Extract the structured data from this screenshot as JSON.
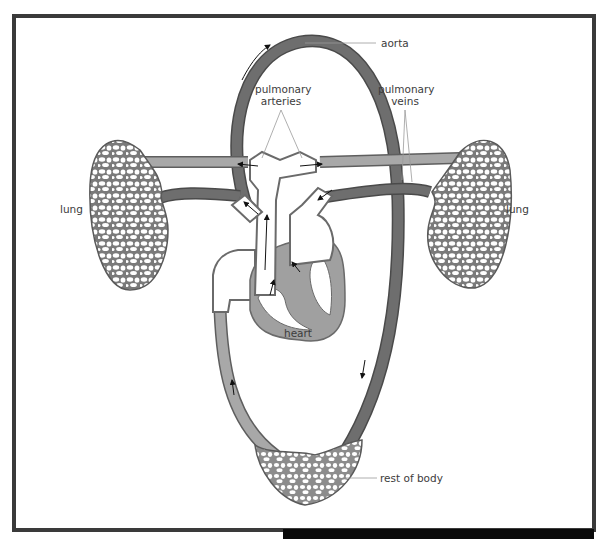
{
  "diagram": {
    "labels": {
      "aorta": "aorta",
      "pulmonary_arteries_line1": "pulmonary",
      "pulmonary_arteries_line2": "arteries",
      "pulmonary_veins_line1": "pulmonary",
      "pulmonary_veins_line2": "veins",
      "lung_left": "lung",
      "lung_right": "lung",
      "heart": "heart",
      "rest_of_body": "rest of body"
    },
    "colors": {
      "frame": "#3a3a3a",
      "oxygenated_vessel": "#6e6e6e",
      "deoxygenated_vessel": "#a8a8a8",
      "heart_wall": "#a0a0a0",
      "vessel_outline": "#4a4a4a",
      "label_text": "#3c3c3c",
      "leader_line": "#9a9a9a"
    }
  }
}
